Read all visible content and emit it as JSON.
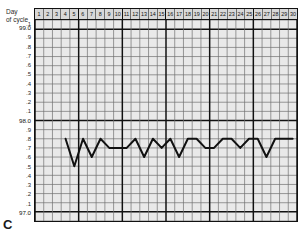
{
  "panel": {
    "letter": "C"
  },
  "axis": {
    "x_caption_line1": "Day",
    "x_caption_line2": "of cycle"
  },
  "chart_data": {
    "type": "line",
    "title": "",
    "subtitle": "",
    "xlabel": "Day of cycle",
    "ylabel": "",
    "grid": true,
    "legend": false,
    "xlim": [
      1,
      30
    ],
    "ylim": [
      97.0,
      99.0
    ],
    "categories": [
      "1",
      "2",
      "3",
      "4",
      "5",
      "6",
      "7",
      "8",
      "9",
      "10",
      "11",
      "12",
      "13",
      "14",
      "15",
      "16",
      "17",
      "18",
      "19",
      "20",
      "21",
      "22",
      "23",
      "24",
      "25",
      "26",
      "27",
      "28",
      "29",
      "30"
    ],
    "ytick_labels": [
      "99.0",
      ".9",
      ".8",
      ".7",
      ".6",
      ".5",
      ".4",
      ".3",
      ".2",
      ".1",
      "98.0",
      ".9",
      ".8",
      ".7",
      ".6",
      ".5",
      ".4",
      ".3",
      ".2",
      ".1",
      "97.0"
    ],
    "ytick_values": [
      99.0,
      98.9,
      98.8,
      98.7,
      98.6,
      98.5,
      98.4,
      98.3,
      98.2,
      98.1,
      98.0,
      97.9,
      97.8,
      97.7,
      97.6,
      97.5,
      97.4,
      97.3,
      97.2,
      97.1,
      97.0
    ],
    "ytick_top_partial": ".1",
    "major_y_values": [
      99.0,
      98.0,
      97.0
    ],
    "major_x_interval": 5,
    "series": [
      {
        "name": "Basal body temperature",
        "x": [
          4,
          5,
          6,
          7,
          8,
          9,
          10,
          11,
          12,
          13,
          14,
          15,
          16,
          17,
          18,
          19,
          20,
          21,
          22,
          23,
          24,
          25,
          26,
          27,
          28,
          29,
          30
        ],
        "values": [
          97.8,
          97.5,
          97.8,
          97.6,
          97.8,
          97.7,
          97.7,
          97.7,
          97.8,
          97.6,
          97.8,
          97.7,
          97.8,
          97.6,
          97.8,
          97.8,
          97.7,
          97.7,
          97.8,
          97.8,
          97.7,
          97.8,
          97.8,
          97.6,
          97.8,
          97.8,
          97.8
        ]
      }
    ]
  },
  "style": {
    "line_color": "#111111",
    "grid_minor_color": "#6f6f6f",
    "grid_major_color": "#111111",
    "plot_background": "#e9e9e9",
    "header_background": "#d8d8d8",
    "text_color": "#2a2a2a"
  }
}
